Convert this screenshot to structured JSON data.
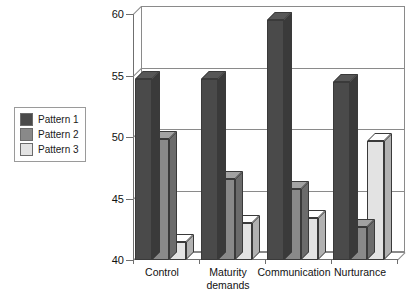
{
  "legend": {
    "position": "left",
    "items": [
      {
        "label": "Pattern 1",
        "color": "#4a4a4a"
      },
      {
        "label": "Pattern 2",
        "color": "#898989"
      },
      {
        "label": "Pattern 3",
        "color": "#e3e3e3"
      }
    ]
  },
  "axis": {
    "y_ticks": [
      "40",
      "45",
      "50",
      "55",
      "60"
    ],
    "x_labels_line1": [
      "Control",
      "Maturity",
      "Communication",
      "Nurturance"
    ],
    "x_labels_line2": [
      "",
      "demands",
      "",
      ""
    ]
  },
  "chart_data": {
    "type": "bar",
    "title": "",
    "subtitle": "",
    "xlabel": "",
    "ylabel": "",
    "ylim": [
      40,
      60
    ],
    "yticks": [
      40,
      45,
      50,
      55,
      60
    ],
    "grid": true,
    "legend_position": "left",
    "style": "3d-grouped-column",
    "categories": [
      "Control",
      "Maturity demands",
      "Communication",
      "Nurturance"
    ],
    "series": [
      {
        "name": "Pattern 1",
        "color": "#4a4a4a",
        "values": [
          54.7,
          54.7,
          59.5,
          54.5
        ]
      },
      {
        "name": "Pattern 2",
        "color": "#898989",
        "values": [
          49.8,
          46.6,
          45.8,
          42.7
        ]
      },
      {
        "name": "Pattern 3",
        "color": "#e3e3e3",
        "values": [
          41.5,
          43.0,
          43.4,
          49.7
        ]
      }
    ]
  }
}
